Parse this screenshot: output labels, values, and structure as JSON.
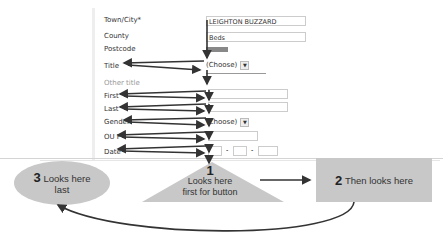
{
  "form": {
    "fields": [
      {
        "label": "Town/City*",
        "value": "LEIGHTON BUZZARD",
        "type": "text"
      },
      {
        "label": "County",
        "value": "Beds",
        "type": "text"
      },
      {
        "label": "Postcode",
        "value": "",
        "type": "text"
      },
      {
        "label": "Title",
        "value": "(Choose)",
        "type": "select"
      },
      {
        "label": "Other title",
        "value": "",
        "type": "text"
      },
      {
        "label": "First",
        "value": "",
        "type": "text"
      },
      {
        "label": "Last",
        "value": "",
        "type": "text"
      },
      {
        "label": "Gender",
        "value": "(Choose)",
        "type": "select"
      },
      {
        "label": "OU P",
        "value": "",
        "type": "text"
      },
      {
        "label": "Date",
        "value": "",
        "type": "date"
      }
    ],
    "dropdown_icon": "chevron-down-icon",
    "date_separator": "-"
  },
  "annotations": {
    "step1": {
      "number": "1",
      "text_line1": "Looks here",
      "text_line2": "first for button"
    },
    "step2": {
      "number": "2",
      "text": "Then looks here"
    },
    "step3": {
      "number": "3",
      "text_line1": "Looks here",
      "text_line2": "last"
    }
  },
  "colors": {
    "shape_fill": "#c8c8c8",
    "arrow": "#333333"
  }
}
